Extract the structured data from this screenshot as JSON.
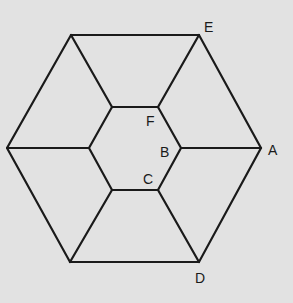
{
  "diagram": {
    "type": "hexagon-figure",
    "background": "#e2e2e2",
    "line_color": "#1a1a1a",
    "vertices": {
      "outer_left": [
        7,
        148
      ],
      "A": [
        261,
        148
      ],
      "outer_top_left": [
        71,
        35
      ],
      "E": [
        199,
        35
      ],
      "outer_bottom_left": [
        70,
        262
      ],
      "D": [
        199,
        262
      ],
      "inner_top_left": [
        112,
        107
      ],
      "F": [
        158,
        107
      ],
      "B": [
        181,
        148
      ],
      "C": [
        158,
        190
      ],
      "inner_bottom_left": [
        112,
        190
      ],
      "inner_left": [
        89,
        148
      ]
    },
    "labels": [
      {
        "text": "E",
        "x": 204,
        "y": 20
      },
      {
        "text": "A",
        "x": 268,
        "y": 143
      },
      {
        "text": "D",
        "x": 195,
        "y": 271
      },
      {
        "text": "F",
        "x": 146,
        "y": 114
      },
      {
        "text": "B",
        "x": 160,
        "y": 145
      },
      {
        "text": "C",
        "x": 143,
        "y": 172
      }
    ]
  }
}
